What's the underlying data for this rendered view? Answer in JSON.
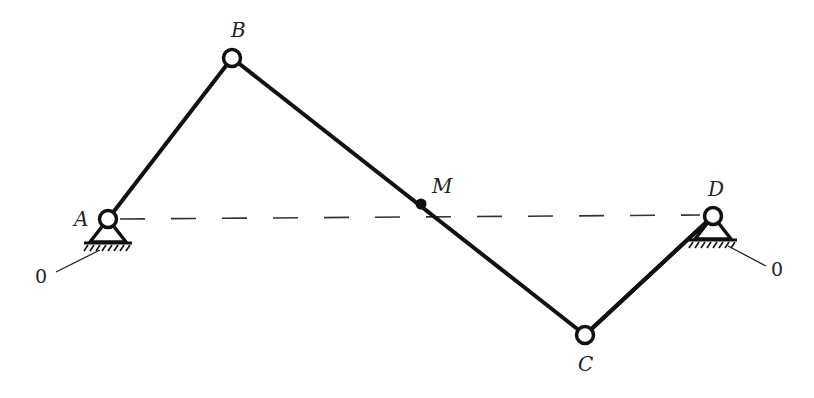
{
  "diagram": {
    "type": "four-bar linkage",
    "colors": {
      "link": "#111111",
      "dashed": "#333333",
      "background": "#ffffff"
    },
    "joints": {
      "A": {
        "label": "A",
        "x": 108,
        "y": 219,
        "kind": "fixed-pivot"
      },
      "B": {
        "label": "B",
        "x": 232,
        "y": 58,
        "kind": "pin"
      },
      "C": {
        "label": "C",
        "x": 585,
        "y": 335,
        "kind": "pin"
      },
      "D": {
        "label": "D",
        "x": 713,
        "y": 216,
        "kind": "fixed-pivot"
      },
      "M": {
        "label": "M",
        "x": 421,
        "y": 204,
        "kind": "point"
      }
    },
    "links": [
      "AB",
      "BC",
      "CD"
    ],
    "reference_line": {
      "from": "A",
      "to": "D",
      "style": "dashed"
    },
    "ground_labels": {
      "left": "0",
      "right": "0"
    }
  }
}
